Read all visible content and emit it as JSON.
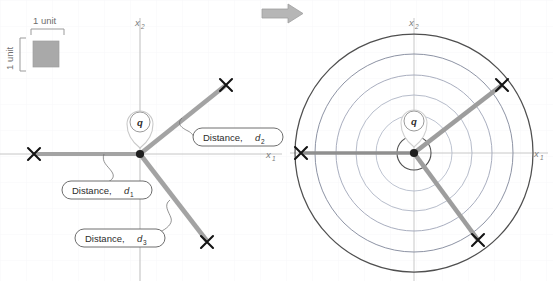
{
  "diagram": {
    "colors": {
      "ray": "#9e9e9e",
      "ray_dark": "#8a8a8a",
      "marker": "#1a1a1a",
      "axis": "#9a9a9a",
      "axis_label": "#7d7d7d",
      "circle_outer": "#4a4a4a",
      "circle_inner": "#b9bfcf",
      "grid": "#eef0f4",
      "callout_border": "#5a5a5a",
      "callout_fill": "#ffffff",
      "legend_square": "#a8a8a8",
      "arrow": "#b3b3b3",
      "pin": "#cfcfcf"
    },
    "legend": {
      "name": "unit-scale-legend",
      "horizontal_label": "1 unit",
      "vertical_label": "1 unit"
    },
    "transition_arrow": {
      "name": "transition-arrow",
      "direction": "right"
    },
    "left_panel": {
      "name": "left-diagram",
      "axis_x_label": "x",
      "axis_x_sub": "1",
      "axis_y_label": "x",
      "axis_y_sub": "2",
      "query_point_label": "q",
      "origin_label": "origin",
      "rays": [
        {
          "name": "ray-d1",
          "label": "Distance,",
          "sub": "1",
          "var": "d",
          "angle_deg": 180
        },
        {
          "name": "ray-d2",
          "label": "Distance,",
          "sub": "2",
          "var": "d",
          "angle_deg": 45
        },
        {
          "name": "ray-d3",
          "label": "Distance,",
          "sub": "3",
          "var": "d",
          "angle_deg": -45
        }
      ],
      "callouts": [
        {
          "name": "callout-d1",
          "text": "Distance,",
          "var": "d",
          "sub": "1"
        },
        {
          "name": "callout-d2",
          "text": "Distance,",
          "var": "d",
          "sub": "2"
        },
        {
          "name": "callout-d3",
          "text": "Distance,",
          "var": "d",
          "sub": "3"
        }
      ]
    },
    "right_panel": {
      "name": "right-diagram",
      "axis_x_label": "x",
      "axis_x_sub": "1",
      "axis_y_label": "x",
      "axis_y_sub": "2",
      "query_point_label": "q",
      "circle_count": 6,
      "circle_radii": [
        17,
        38,
        58,
        78,
        99,
        119
      ]
    }
  }
}
